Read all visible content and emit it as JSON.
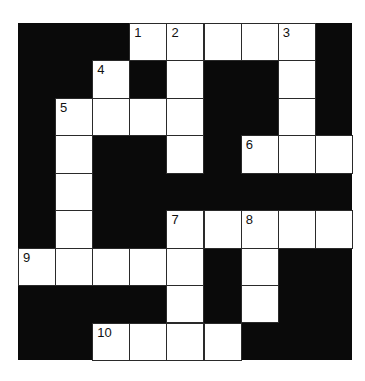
{
  "puzzle": {
    "rows": 9,
    "cols": 9,
    "colors": {
      "block": "#0a0a0a",
      "cell": "#ffffff",
      "line": "#2a2a2a"
    },
    "cells": [
      {
        "r": 0,
        "c": 3,
        "num": "1"
      },
      {
        "r": 0,
        "c": 4,
        "num": "2"
      },
      {
        "r": 0,
        "c": 5
      },
      {
        "r": 0,
        "c": 6
      },
      {
        "r": 0,
        "c": 7,
        "num": "3"
      },
      {
        "r": 1,
        "c": 2,
        "num": "4"
      },
      {
        "r": 1,
        "c": 4
      },
      {
        "r": 1,
        "c": 7
      },
      {
        "r": 2,
        "c": 1,
        "num": "5"
      },
      {
        "r": 2,
        "c": 2
      },
      {
        "r": 2,
        "c": 3
      },
      {
        "r": 2,
        "c": 4
      },
      {
        "r": 2,
        "c": 7
      },
      {
        "r": 3,
        "c": 1
      },
      {
        "r": 3,
        "c": 4
      },
      {
        "r": 3,
        "c": 6,
        "num": "6"
      },
      {
        "r": 3,
        "c": 7
      },
      {
        "r": 3,
        "c": 8
      },
      {
        "r": 4,
        "c": 1
      },
      {
        "r": 5,
        "c": 1
      },
      {
        "r": 5,
        "c": 4,
        "num": "7"
      },
      {
        "r": 5,
        "c": 5
      },
      {
        "r": 5,
        "c": 6,
        "num": "8"
      },
      {
        "r": 5,
        "c": 7
      },
      {
        "r": 5,
        "c": 8
      },
      {
        "r": 6,
        "c": 0,
        "num": "9"
      },
      {
        "r": 6,
        "c": 1
      },
      {
        "r": 6,
        "c": 2
      },
      {
        "r": 6,
        "c": 3
      },
      {
        "r": 6,
        "c": 4
      },
      {
        "r": 6,
        "c": 6
      },
      {
        "r": 7,
        "c": 4
      },
      {
        "r": 7,
        "c": 6
      },
      {
        "r": 8,
        "c": 2,
        "num": "10"
      },
      {
        "r": 8,
        "c": 3
      },
      {
        "r": 8,
        "c": 4
      },
      {
        "r": 8,
        "c": 5
      }
    ]
  }
}
